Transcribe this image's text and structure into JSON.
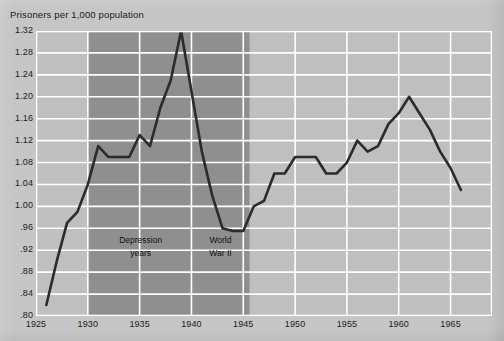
{
  "chart_data": {
    "type": "line",
    "title": "Prisoners per 1,000 population",
    "xlabel": "",
    "ylabel": "Prisoners per 1,000 population",
    "xlim": [
      1925,
      1969
    ],
    "ylim": [
      0.8,
      1.32
    ],
    "grid": true,
    "legend": "none",
    "y_ticks": [
      "1.32",
      "1.28",
      "1.24",
      "1.20",
      "1.16",
      "1.12",
      "1.08",
      "1.04",
      "1.00",
      ".96",
      ".92",
      ".88",
      ".84",
      ".80"
    ],
    "y_tick_values": [
      1.32,
      1.28,
      1.24,
      1.2,
      1.16,
      1.12,
      1.08,
      1.04,
      1.0,
      0.96,
      0.92,
      0.88,
      0.84,
      0.8
    ],
    "x_ticks": [
      "1925",
      "1930",
      "1935",
      "1940",
      "1945",
      "1950",
      "1955",
      "1960",
      "1965"
    ],
    "x_tick_values": [
      1925,
      1930,
      1935,
      1940,
      1945,
      1950,
      1955,
      1960,
      1965
    ],
    "series": [
      {
        "name": "Prisoners per 1,000 population",
        "color": "#2b2b2b",
        "x": [
          1926,
          1927,
          1928,
          1929,
          1930,
          1931,
          1932,
          1933,
          1934,
          1935,
          1936,
          1937,
          1938,
          1939,
          1940,
          1941,
          1942,
          1943,
          1944,
          1945,
          1946,
          1947,
          1948,
          1949,
          1950,
          1951,
          1952,
          1953,
          1954,
          1955,
          1956,
          1957,
          1958,
          1959,
          1960,
          1961,
          1962,
          1963,
          1964,
          1965,
          1966
        ],
        "values": [
          0.82,
          0.9,
          0.97,
          0.99,
          1.04,
          1.11,
          1.09,
          1.09,
          1.09,
          1.13,
          1.11,
          1.18,
          1.23,
          1.32,
          1.21,
          1.1,
          1.02,
          0.96,
          0.955,
          0.955,
          1.0,
          1.01,
          1.06,
          1.06,
          1.09,
          1.09,
          1.09,
          1.06,
          1.06,
          1.08,
          1.12,
          1.1,
          1.11,
          1.15,
          1.17,
          1.2,
          1.17,
          1.14,
          1.1,
          1.07,
          1.03
        ]
      }
    ],
    "shaded_regions": [
      {
        "name": "Depression years",
        "label_lines": [
          "Depression",
          "years"
        ],
        "x_start": 1930,
        "x_end": 1945.6,
        "color": "#8f8f8f"
      }
    ],
    "annotations": [
      {
        "name": "depression-years",
        "lines": [
          "Depression",
          "years"
        ],
        "x": 1935.1,
        "y": 0.925
      },
      {
        "name": "world-war-ii",
        "lines": [
          "World",
          "War II"
        ],
        "x": 1942.8,
        "y": 0.925
      }
    ],
    "colors": {
      "plot_background": "#bfbfbf",
      "shaded_background": "#8f8f8f",
      "grid": "#ffffff",
      "line": "#2b2b2b",
      "page_background": "#c6c6c6",
      "text": "#1b1b1b"
    }
  }
}
